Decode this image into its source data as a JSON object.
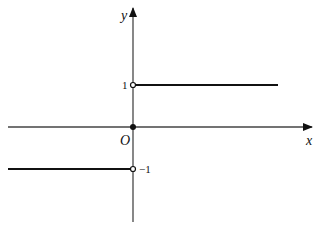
{
  "diagram": {
    "type": "piecewise step function graph (sign function)",
    "axes": {
      "x_label": "x",
      "y_label": "y",
      "origin_label": "O"
    },
    "tick_labels": {
      "y_pos": "1",
      "y_neg": "−1"
    },
    "segments": [
      {
        "name": "upper",
        "y": 1,
        "x_range": "x > 0",
        "endpoint_at_0": "open"
      },
      {
        "name": "zero",
        "y": 0,
        "x": 0,
        "point": "closed"
      },
      {
        "name": "lower",
        "y": -1,
        "x_range": "x < 0",
        "endpoint_at_0": "open"
      }
    ],
    "colors": {
      "ink": "#111111",
      "axis": "#555555",
      "background": "#ffffff"
    }
  }
}
